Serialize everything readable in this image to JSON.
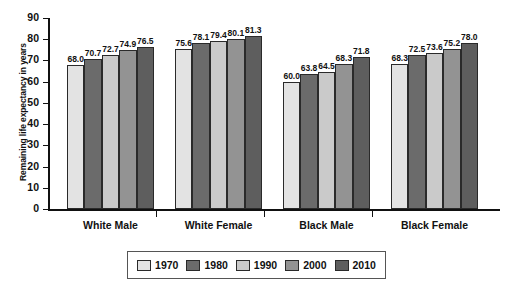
{
  "chart_data": {
    "type": "bar",
    "title": "",
    "subtitle": "",
    "xlabel": "",
    "ylabel": "Remaining life expectancy in years",
    "ylim": [
      0,
      90
    ],
    "ytick_step": 10,
    "yticks": [
      "90",
      "80",
      "70",
      "60",
      "50",
      "40",
      "30",
      "20",
      "10",
      "0"
    ],
    "grid": false,
    "legend_position": "bottom",
    "categories": [
      "White Male",
      "White Female",
      "Black Male",
      "Black Female"
    ],
    "series": [
      {
        "name": "1970",
        "color": "#e3e3e3",
        "values": [
          68.0,
          75.6,
          60.0,
          68.3
        ],
        "labels": [
          "68.0",
          "75.6",
          "60.0",
          "68.3"
        ]
      },
      {
        "name": "1980",
        "color": "#6b6b6b",
        "values": [
          70.7,
          78.1,
          63.8,
          72.5
        ],
        "labels": [
          "70.7",
          "78.1",
          "63.8",
          "72.5"
        ]
      },
      {
        "name": "1990",
        "color": "#cacaca",
        "values": [
          72.7,
          79.4,
          64.5,
          73.6
        ],
        "labels": [
          "72.7",
          "79.4",
          "64.5",
          "73.6"
        ]
      },
      {
        "name": "2000",
        "color": "#939393",
        "values": [
          74.9,
          80.1,
          68.3,
          75.2
        ],
        "labels": [
          "74.9",
          "80.1",
          "68.3",
          "75.2"
        ]
      },
      {
        "name": "2010",
        "color": "#5e5e5e",
        "values": [
          76.5,
          81.3,
          71.8,
          78.0
        ],
        "labels": [
          "76.5",
          "81.3",
          "71.8",
          "78.0"
        ]
      }
    ]
  },
  "axis": {
    "y_title": "Remaining life expectancy in years"
  },
  "legend": {
    "entries": [
      {
        "label": "1970"
      },
      {
        "label": "1980"
      },
      {
        "label": "1990"
      },
      {
        "label": "2000"
      },
      {
        "label": "2010"
      }
    ]
  }
}
